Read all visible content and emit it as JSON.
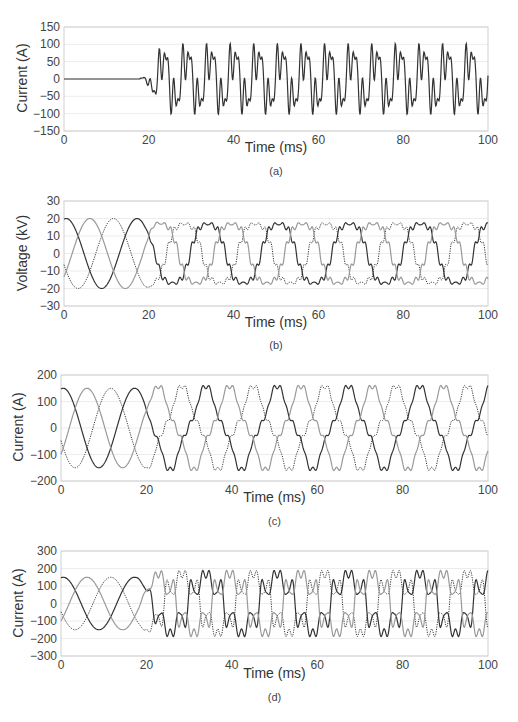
{
  "chart_data": [
    {
      "id": "a",
      "type": "line",
      "caption": "(a)",
      "title": "",
      "xlabel": "Time (ms)",
      "ylabel": "Current (A)",
      "xlim": [
        0,
        100
      ],
      "ylim": [
        -150,
        150
      ],
      "xticks": [
        0,
        20,
        40,
        60,
        80,
        100
      ],
      "yticks": [
        150,
        100,
        50,
        0,
        -50,
        -100,
        -150
      ],
      "grid": true,
      "legend": null,
      "series": [
        {
          "name": "neutral current",
          "style": "solid",
          "color": "#333333",
          "description": "Zero until ~18 ms, then distorted periodic waveform with positive peaks ~130 A and negative peaks ~-130 A, period ~16.7 ms",
          "key_points": [
            [
              0,
              0
            ],
            [
              18,
              0
            ],
            [
              19,
              12
            ],
            [
              22,
              -25
            ],
            [
              24.5,
              -72
            ],
            [
              27.5,
              -42
            ],
            [
              30,
              50
            ],
            [
              33,
              107
            ],
            [
              35.5,
              55
            ],
            [
              38.5,
              -60
            ],
            [
              41.5,
              -122
            ],
            [
              44.5,
              -62
            ],
            [
              47.5,
              62
            ],
            [
              50,
              130
            ],
            [
              53,
              62
            ],
            [
              55.5,
              -62
            ],
            [
              58,
              -130
            ],
            [
              61,
              -62
            ],
            [
              63.5,
              62
            ],
            [
              66.5,
              130
            ],
            [
              69.5,
              62
            ],
            [
              72,
              -62
            ],
            [
              75,
              -130
            ],
            [
              78,
              -62
            ],
            [
              80.5,
              62
            ],
            [
              83,
              130
            ],
            [
              86,
              62
            ],
            [
              88.5,
              -62
            ],
            [
              91.5,
              -130
            ],
            [
              94.5,
              -62
            ],
            [
              97,
              62
            ],
            [
              100,
              130
            ]
          ]
        }
      ]
    },
    {
      "id": "b",
      "type": "line",
      "caption": "(b)",
      "title": "",
      "xlabel": "Time (ms)",
      "ylabel": "Voltage (kV)",
      "xlim": [
        0,
        100
      ],
      "ylim": [
        -30,
        30
      ],
      "xticks": [
        0,
        20,
        40,
        60,
        80,
        100
      ],
      "yticks": [
        30,
        20,
        10,
        0,
        -10,
        -20,
        -30
      ],
      "grid": true,
      "legend": null,
      "series": [
        {
          "name": "phase A",
          "style": "solid",
          "color": "#333333",
          "amplitude": 20,
          "phase_deg": 60,
          "period_ms": 16.7
        },
        {
          "name": "phase B",
          "style": "dotted",
          "color": "#333333",
          "amplitude": 20,
          "phase_deg": 180,
          "period_ms": 16.7
        },
        {
          "name": "phase C",
          "style": "solid",
          "color": "#999999",
          "amplitude": 20,
          "phase_deg": -60,
          "period_ms": 16.7
        }
      ],
      "note": "Sinusoidal until ~20 ms, then flattened/distorted peaks around ±20 kV"
    },
    {
      "id": "c",
      "type": "line",
      "caption": "(c)",
      "title": "",
      "xlabel": "Time (ms)",
      "ylabel": "Current (A)",
      "xlim": [
        0,
        100
      ],
      "ylim": [
        -200,
        200
      ],
      "xticks": [
        0,
        20,
        40,
        60,
        80,
        100
      ],
      "yticks": [
        200,
        100,
        0,
        -100,
        -200
      ],
      "grid": true,
      "legend": null,
      "series": [
        {
          "name": "phase A",
          "style": "solid",
          "color": "#333333",
          "amplitude": 150,
          "amplitude_after_20ms": 170,
          "period_ms": 16.7
        },
        {
          "name": "phase B",
          "style": "dotted",
          "color": "#333333",
          "amplitude": 150,
          "amplitude_after_20ms": 170,
          "period_ms": 16.7
        },
        {
          "name": "phase C",
          "style": "solid",
          "color": "#999999",
          "amplitude": 150,
          "amplitude_after_20ms": 170,
          "period_ms": 16.7
        }
      ],
      "note": "Sinusoidal ±150 A until ~20 ms, then peaky distorted waveform peaking ~±170 A"
    },
    {
      "id": "d",
      "type": "line",
      "caption": "(d)",
      "title": "",
      "xlabel": "Time (ms)",
      "ylabel": "Current (A)",
      "xlim": [
        0,
        100
      ],
      "ylim": [
        -300,
        300
      ],
      "xticks": [
        0,
        20,
        40,
        60,
        80,
        100
      ],
      "yticks": [
        300,
        200,
        100,
        0,
        -100,
        -200,
        -300
      ],
      "grid": true,
      "legend": null,
      "series": [
        {
          "name": "phase A",
          "style": "solid",
          "color": "#333333",
          "amplitude": 150,
          "peak_after_20ms": 270,
          "period_ms": 16.7
        },
        {
          "name": "phase B",
          "style": "dotted",
          "color": "#333333",
          "amplitude": 150,
          "peak_after_20ms": 270,
          "period_ms": 16.7
        },
        {
          "name": "phase C",
          "style": "solid",
          "color": "#999999",
          "amplitude": 150,
          "peak_after_20ms": 270,
          "period_ms": 16.7
        }
      ],
      "note": "Sinusoidal ±150 A until ~20 ms, then strongly distorted with sharp peaks ~±260 A"
    }
  ],
  "layout": {
    "panels": [
      {
        "plot": [
          64,
          27,
          488,
          131
        ],
        "ylabel_x": 22,
        "xlabel_y": 147,
        "caption_y": 172
      },
      {
        "plot": [
          64,
          201,
          488,
          306
        ],
        "ylabel_x": 22,
        "xlabel_y": 322,
        "caption_y": 346
      },
      {
        "plot": [
          61,
          375,
          488,
          481
        ],
        "ylabel_x": 18,
        "xlabel_y": 497,
        "caption_y": 522
      },
      {
        "plot": [
          61,
          551,
          488,
          656
        ],
        "ylabel_x": 18,
        "xlabel_y": 673,
        "caption_y": 698
      }
    ]
  }
}
